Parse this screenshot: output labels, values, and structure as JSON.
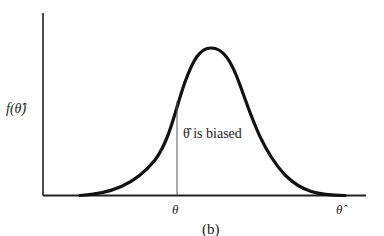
{
  "figure": {
    "caption": "(b)",
    "y_axis_label": "f(θ̂)",
    "x_axis_label": "θ̂",
    "true_param_label": "θ",
    "annotation": "θ̂ is biased",
    "curve": {
      "type": "bell-shaped density",
      "peak_x_px": 211,
      "true_param_x_px": 177,
      "description": "sampling distribution of estimator centered right of true parameter (biased)"
    },
    "colors": {
      "curve": "#111111",
      "axes": "#222222",
      "marker_line": "#555555"
    }
  }
}
